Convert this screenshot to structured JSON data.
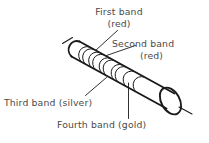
{
  "figure": {
    "background_color": "#ffffff",
    "line_color": "#1a1a1a",
    "text_color": "#4a4a4a",
    "labels": {
      "first_band": {
        "line1": "First band",
        "line2": "(red)"
      },
      "second_band": {
        "line1": "Second band",
        "line2": "(red)"
      },
      "third_band": {
        "line1": "Third band (silver)"
      },
      "fourth_band": {
        "line1": "Fourth band (gold)"
      }
    }
  }
}
